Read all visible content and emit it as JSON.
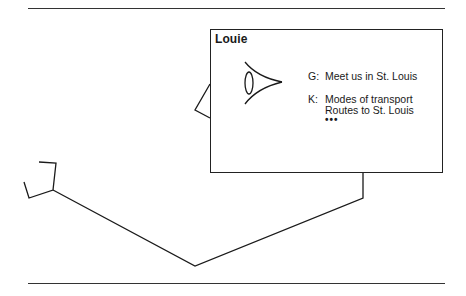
{
  "card": {
    "title": "Louie",
    "icon": "eye-icon",
    "entries": [
      {
        "key": "G:",
        "lines": [
          "Meet us in St. Louis"
        ]
      },
      {
        "key": "K:",
        "lines": [
          "Modes of transport",
          "Routes to St. Louis"
        ]
      }
    ],
    "more": "•••"
  },
  "colors": {
    "ink": "#1a1a1a",
    "background": "#ffffff"
  }
}
